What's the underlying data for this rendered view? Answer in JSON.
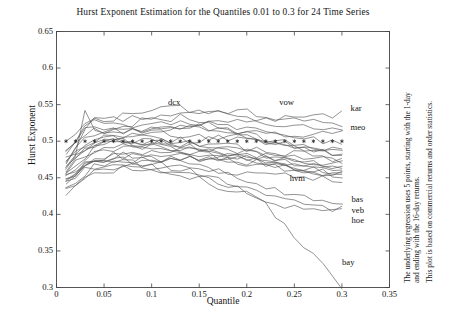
{
  "chart_data": {
    "type": "line",
    "title": "Hurst Exponent Estimation for the Quantiles 0.01 to 0.3 for 24 Time Series",
    "xlabel": "Quantile",
    "ylabel": "Hurst Exponent",
    "xlim": [
      0,
      0.35
    ],
    "ylim": [
      0.3,
      0.65
    ],
    "xticks": [
      "0",
      "0.05",
      "0.1",
      "0.15",
      "0.2",
      "0.25",
      "0.3",
      "0.35"
    ],
    "xtick_values": [
      0,
      0.05,
      0.1,
      0.15,
      0.2,
      0.25,
      0.3,
      0.35
    ],
    "yticks": [
      "0.3",
      "0.35",
      "0.4",
      "0.45",
      "0.5",
      "0.55",
      "0.6",
      "0.65"
    ],
    "ytick_values": [
      0.3,
      0.35,
      0.4,
      0.45,
      0.5,
      0.55,
      0.6,
      0.65
    ],
    "grid": false,
    "legend": "inline-end-labels",
    "line_color": "#555555",
    "reference_line": {
      "name": "random-walk-reference",
      "y": 0.5,
      "style": "star-markers",
      "marker": "*",
      "x_start": 0.01,
      "x_end": 0.3,
      "marker_count": 30
    },
    "x": [
      0.01,
      0.02,
      0.03,
      0.04,
      0.05,
      0.06,
      0.07,
      0.08,
      0.09,
      0.1,
      0.11,
      0.12,
      0.13,
      0.14,
      0.15,
      0.16,
      0.17,
      0.18,
      0.19,
      0.2,
      0.21,
      0.22,
      0.23,
      0.24,
      0.25,
      0.26,
      0.27,
      0.28,
      0.29,
      0.3
    ],
    "series": [
      {
        "name": "dcx",
        "label": "dcx",
        "label_x": 0.115,
        "label_y": 0.552,
        "values": [
          0.47,
          0.495,
          0.516,
          0.534,
          0.527,
          0.533,
          0.528,
          0.534,
          0.531,
          0.535,
          0.533,
          0.529,
          0.534,
          0.53,
          0.525,
          0.522,
          0.519,
          0.515,
          0.511,
          0.508,
          0.505,
          0.503,
          0.501,
          0.498,
          0.494,
          0.489,
          0.484,
          0.48,
          0.477,
          0.474
        ]
      },
      {
        "name": "vow",
        "label": "vow",
        "label_x": 0.232,
        "label_y": 0.552,
        "values": [
          0.487,
          0.497,
          0.508,
          0.514,
          0.511,
          0.517,
          0.52,
          0.524,
          0.527,
          0.53,
          0.533,
          0.535,
          0.537,
          0.539,
          0.54,
          0.541,
          0.542,
          0.542,
          0.541,
          0.54,
          0.538,
          0.536,
          0.533,
          0.531,
          0.529,
          0.527,
          0.525,
          0.524,
          0.523,
          0.522
        ]
      },
      {
        "name": "kar",
        "label": "kar",
        "label_x": 0.307,
        "label_y": 0.544,
        "values": [
          0.455,
          0.468,
          0.48,
          0.489,
          0.495,
          0.5,
          0.505,
          0.508,
          0.512,
          0.515,
          0.517,
          0.519,
          0.521,
          0.522,
          0.523,
          0.524,
          0.525,
          0.526,
          0.527,
          0.528,
          0.529,
          0.53,
          0.531,
          0.532,
          0.533,
          0.534,
          0.534,
          0.535,
          0.535,
          0.536
        ]
      },
      {
        "name": "meo",
        "label": "meo",
        "label_x": 0.307,
        "label_y": 0.518,
        "values": [
          0.462,
          0.478,
          0.492,
          0.498,
          0.5,
          0.5,
          0.499,
          0.498,
          0.498,
          0.498,
          0.499,
          0.5,
          0.501,
          0.502,
          0.503,
          0.505,
          0.507,
          0.509,
          0.51,
          0.511,
          0.511,
          0.511,
          0.51,
          0.51,
          0.51,
          0.51,
          0.51,
          0.51,
          0.51,
          0.51
        ]
      },
      {
        "name": "hvm",
        "label": "hvm",
        "label_x": 0.243,
        "label_y": 0.449,
        "values": [
          0.47,
          0.48,
          0.492,
          0.498,
          0.5,
          0.501,
          0.5,
          0.498,
          0.496,
          0.493,
          0.491,
          0.489,
          0.487,
          0.485,
          0.483,
          0.481,
          0.478,
          0.475,
          0.472,
          0.47,
          0.468,
          0.466,
          0.464,
          0.462,
          0.46,
          0.458,
          0.456,
          0.455,
          0.454,
          0.453
        ]
      },
      {
        "name": "bas",
        "label": "bas",
        "label_x": 0.308,
        "label_y": 0.42,
        "values": [
          0.452,
          0.462,
          0.47,
          0.475,
          0.478,
          0.48,
          0.48,
          0.479,
          0.478,
          0.477,
          0.475,
          0.473,
          0.47,
          0.467,
          0.464,
          0.461,
          0.457,
          0.453,
          0.449,
          0.445,
          0.441,
          0.437,
          0.433,
          0.43,
          0.427,
          0.424,
          0.422,
          0.42,
          0.419,
          0.418
        ]
      },
      {
        "name": "veb",
        "label": "veb",
        "label_x": 0.308,
        "label_y": 0.405,
        "values": [
          0.447,
          0.457,
          0.465,
          0.47,
          0.473,
          0.474,
          0.474,
          0.473,
          0.471,
          0.469,
          0.467,
          0.464,
          0.461,
          0.458,
          0.454,
          0.45,
          0.446,
          0.442,
          0.438,
          0.433,
          0.429,
          0.425,
          0.421,
          0.418,
          0.415,
          0.412,
          0.41,
          0.409,
          0.408,
          0.407
        ]
      },
      {
        "name": "hoe",
        "label": "hoe",
        "label_x": 0.308,
        "label_y": 0.391,
        "values": [
          0.443,
          0.452,
          0.46,
          0.465,
          0.468,
          0.47,
          0.47,
          0.469,
          0.467,
          0.465,
          0.462,
          0.459,
          0.455,
          0.451,
          0.447,
          0.443,
          0.439,
          0.435,
          0.431,
          0.427,
          0.423,
          0.419,
          0.416,
          0.413,
          0.411,
          0.409,
          0.407,
          0.406,
          0.405,
          0.404
        ]
      },
      {
        "name": "bay",
        "label": "bay",
        "label_x": 0.298,
        "label_y": 0.333,
        "values": [
          0.45,
          0.46,
          0.468,
          0.472,
          0.474,
          0.474,
          0.472,
          0.47,
          0.467,
          0.464,
          0.461,
          0.458,
          0.455,
          0.452,
          0.449,
          0.446,
          0.443,
          0.44,
          0.436,
          0.43,
          0.422,
          0.412,
          0.4,
          0.387,
          0.373,
          0.359,
          0.346,
          0.333,
          0.318,
          0.3
        ]
      },
      {
        "name": "s10",
        "label": "",
        "label_x": null,
        "label_y": null,
        "values": [
          0.5,
          0.512,
          0.524,
          0.53,
          0.526,
          0.531,
          0.536,
          0.54,
          0.543,
          0.545,
          0.546,
          0.546,
          0.545,
          0.543,
          0.541,
          0.539,
          0.537,
          0.535,
          0.533,
          0.531,
          0.529,
          0.527,
          0.525,
          0.523,
          0.521,
          0.519,
          0.517,
          0.516,
          0.515,
          0.514
        ]
      },
      {
        "name": "s11",
        "label": "",
        "label_x": null,
        "label_y": null,
        "values": [
          0.485,
          0.5,
          0.518,
          0.528,
          0.524,
          0.522,
          0.52,
          0.521,
          0.523,
          0.525,
          0.526,
          0.527,
          0.527,
          0.526,
          0.525,
          0.524,
          0.523,
          0.521,
          0.519,
          0.517,
          0.515,
          0.513,
          0.511,
          0.509,
          0.507,
          0.505,
          0.503,
          0.501,
          0.5,
          0.499
        ]
      },
      {
        "name": "s12",
        "label": "",
        "label_x": null,
        "label_y": null,
        "values": [
          0.476,
          0.49,
          0.503,
          0.51,
          0.512,
          0.513,
          0.514,
          0.514,
          0.513,
          0.512,
          0.511,
          0.51,
          0.509,
          0.508,
          0.507,
          0.506,
          0.505,
          0.504,
          0.503,
          0.502,
          0.501,
          0.5,
          0.499,
          0.498,
          0.496,
          0.494,
          0.492,
          0.49,
          0.489,
          0.488
        ]
      },
      {
        "name": "s13",
        "label": "",
        "label_x": null,
        "label_y": null,
        "values": [
          0.468,
          0.482,
          0.496,
          0.503,
          0.505,
          0.506,
          0.506,
          0.505,
          0.504,
          0.503,
          0.502,
          0.501,
          0.5,
          0.499,
          0.498,
          0.497,
          0.496,
          0.495,
          0.493,
          0.491,
          0.489,
          0.487,
          0.485,
          0.483,
          0.481,
          0.479,
          0.477,
          0.475,
          0.474,
          0.473
        ]
      },
      {
        "name": "s14",
        "label": "",
        "label_x": null,
        "label_y": null,
        "values": [
          0.462,
          0.474,
          0.486,
          0.494,
          0.497,
          0.499,
          0.5,
          0.5,
          0.5,
          0.499,
          0.498,
          0.497,
          0.496,
          0.495,
          0.494,
          0.492,
          0.49,
          0.488,
          0.486,
          0.484,
          0.482,
          0.48,
          0.478,
          0.476,
          0.474,
          0.472,
          0.47,
          0.469,
          0.468,
          0.467
        ]
      },
      {
        "name": "s15",
        "label": "",
        "label_x": null,
        "label_y": null,
        "values": [
          0.458,
          0.47,
          0.481,
          0.488,
          0.492,
          0.494,
          0.495,
          0.495,
          0.494,
          0.493,
          0.492,
          0.49,
          0.488,
          0.486,
          0.484,
          0.482,
          0.48,
          0.478,
          0.476,
          0.474,
          0.472,
          0.47,
          0.468,
          0.466,
          0.464,
          0.462,
          0.461,
          0.46,
          0.459,
          0.458
        ]
      },
      {
        "name": "s16",
        "label": "",
        "label_x": null,
        "label_y": null,
        "values": [
          0.44,
          0.452,
          0.463,
          0.471,
          0.476,
          0.479,
          0.481,
          0.482,
          0.482,
          0.482,
          0.481,
          0.48,
          0.479,
          0.478,
          0.477,
          0.476,
          0.475,
          0.474,
          0.473,
          0.472,
          0.471,
          0.47,
          0.469,
          0.468,
          0.467,
          0.466,
          0.465,
          0.464,
          0.464,
          0.463
        ]
      },
      {
        "name": "s17",
        "label": "",
        "label_x": null,
        "label_y": null,
        "values": [
          0.436,
          0.447,
          0.457,
          0.464,
          0.469,
          0.472,
          0.474,
          0.475,
          0.476,
          0.476,
          0.476,
          0.476,
          0.476,
          0.476,
          0.476,
          0.476,
          0.476,
          0.476,
          0.476,
          0.476,
          0.476,
          0.476,
          0.475,
          0.474,
          0.473,
          0.472,
          0.471,
          0.47,
          0.469,
          0.468
        ]
      },
      {
        "name": "s18",
        "label": "",
        "label_x": null,
        "label_y": null,
        "values": [
          0.432,
          0.443,
          0.452,
          0.458,
          0.462,
          0.465,
          0.467,
          0.468,
          0.469,
          0.47,
          0.471,
          0.472,
          0.473,
          0.474,
          0.475,
          0.476,
          0.477,
          0.478,
          0.479,
          0.48,
          0.481,
          0.482,
          0.483,
          0.484,
          0.485,
          0.486,
          0.487,
          0.488,
          0.489,
          0.49
        ]
      },
      {
        "name": "s19",
        "label": "",
        "label_x": null,
        "label_y": null,
        "values": [
          0.428,
          0.438,
          0.447,
          0.453,
          0.457,
          0.46,
          0.462,
          0.463,
          0.464,
          0.464,
          0.464,
          0.464,
          0.464,
          0.463,
          0.462,
          0.461,
          0.46,
          0.459,
          0.458,
          0.457,
          0.456,
          0.455,
          0.454,
          0.453,
          0.452,
          0.451,
          0.45,
          0.449,
          0.449,
          0.448
        ]
      },
      {
        "name": "s20",
        "label": "",
        "label_x": null,
        "label_y": null,
        "values": [
          0.49,
          0.504,
          0.514,
          0.518,
          0.516,
          0.514,
          0.513,
          0.513,
          0.514,
          0.515,
          0.516,
          0.517,
          0.518,
          0.518,
          0.517,
          0.516,
          0.514,
          0.512,
          0.51,
          0.508,
          0.505,
          0.502,
          0.499,
          0.496,
          0.493,
          0.49,
          0.487,
          0.485,
          0.483,
          0.482
        ]
      },
      {
        "name": "s21",
        "label": "",
        "label_x": null,
        "label_y": null,
        "values": [
          0.466,
          0.484,
          0.545,
          0.52,
          0.514,
          0.512,
          0.511,
          0.512,
          0.514,
          0.516,
          0.518,
          0.519,
          0.52,
          0.52,
          0.519,
          0.517,
          0.515,
          0.513,
          0.51,
          0.507,
          0.504,
          0.501,
          0.498,
          0.495,
          0.492,
          0.489,
          0.487,
          0.485,
          0.484,
          0.483
        ]
      },
      {
        "name": "s22",
        "label": "",
        "label_x": null,
        "label_y": null,
        "values": [
          0.444,
          0.458,
          0.47,
          0.477,
          0.48,
          0.482,
          0.483,
          0.484,
          0.485,
          0.486,
          0.487,
          0.488,
          0.489,
          0.49,
          0.49,
          0.49,
          0.489,
          0.488,
          0.486,
          0.484,
          0.482,
          0.479,
          0.476,
          0.473,
          0.47,
          0.467,
          0.464,
          0.462,
          0.46,
          0.459
        ]
      },
      {
        "name": "s23",
        "label": "",
        "label_x": null,
        "label_y": null,
        "values": [
          0.474,
          0.486,
          0.497,
          0.502,
          0.503,
          0.503,
          0.502,
          0.501,
          0.5,
          0.499,
          0.498,
          0.496,
          0.494,
          0.492,
          0.49,
          0.488,
          0.485,
          0.482,
          0.479,
          0.476,
          0.473,
          0.47,
          0.467,
          0.464,
          0.462,
          0.46,
          0.458,
          0.457,
          0.456,
          0.455
        ]
      },
      {
        "name": "s24",
        "label": "",
        "label_x": null,
        "label_y": null,
        "values": [
          0.45,
          0.466,
          0.478,
          0.485,
          0.488,
          0.49,
          0.491,
          0.492,
          0.493,
          0.493,
          0.493,
          0.492,
          0.491,
          0.49,
          0.488,
          0.486,
          0.484,
          0.482,
          0.479,
          0.476,
          0.473,
          0.47,
          0.467,
          0.464,
          0.462,
          0.46,
          0.458,
          0.457,
          0.456,
          0.455
        ]
      }
    ]
  },
  "caption": {
    "line1": "The underlying regression uses 5 points, starting with the 1-day",
    "line2": "and ending with the 16-day returns.",
    "line3": "This plot is based on commercial returns and order statistics."
  }
}
